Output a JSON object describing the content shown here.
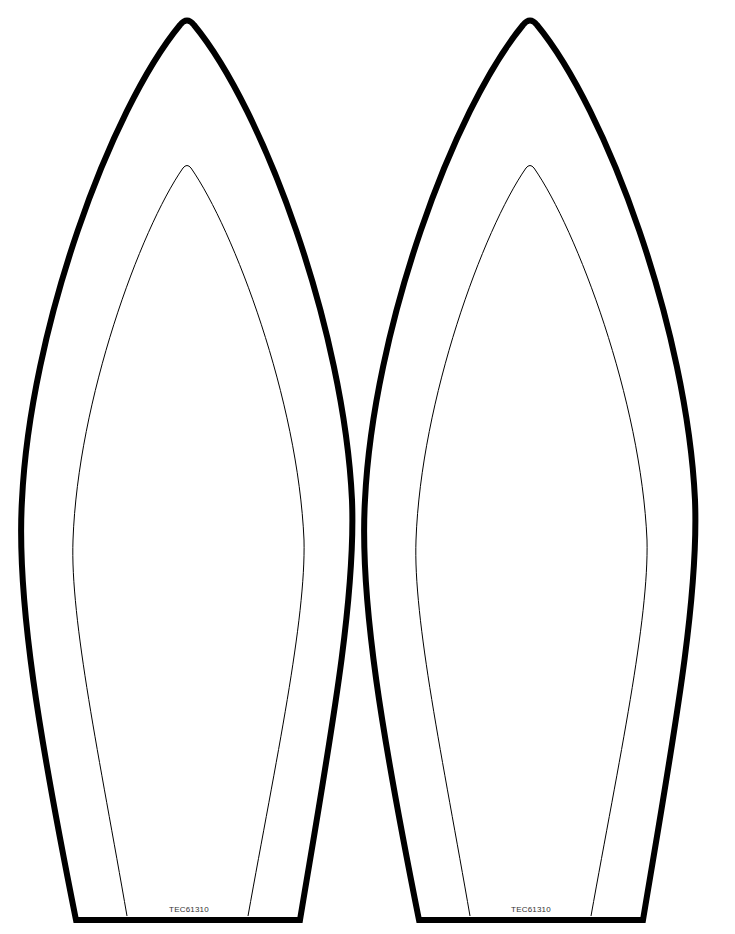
{
  "page": {
    "type": "printable-template",
    "background": "#ffffff",
    "stroke_color": "#000000"
  },
  "ears": [
    {
      "id": "left",
      "code_label": "TEC61310"
    },
    {
      "id": "right",
      "code_label": "TEC61310"
    }
  ]
}
